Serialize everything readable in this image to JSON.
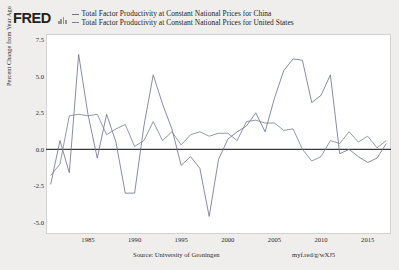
{
  "header": {
    "logo_text": "FRED",
    "logo_mark_name": "fred-bar-chart-mark"
  },
  "legend": {
    "items": [
      {
        "label": "Total Factor Productivity at Constant National Prices for China",
        "color": "#6a6f8e"
      },
      {
        "label": "Total Factor Productivity at Constant National Prices for United States",
        "color": "#7a7f96"
      }
    ]
  },
  "footer": {
    "source": "Source: University of Groningen",
    "url": "myf.red/g/wXJ5"
  },
  "chart_data": {
    "type": "line",
    "title": "",
    "xlabel": "",
    "ylabel": "Percent Change from Year Ago",
    "ylim": [
      -5.8,
      7.9
    ],
    "xlim": [
      1980.5,
      2017.5
    ],
    "yticks": [
      7.5,
      5.0,
      2.5,
      0.0,
      -2.5,
      -5.0
    ],
    "ytick_labels": [
      "7.5",
      "5.0",
      "2.5",
      "0.0",
      "-2.5",
      "-5.0"
    ],
    "xticks": [
      1985,
      1990,
      1995,
      2000,
      2005,
      2010,
      2015
    ],
    "xtick_labels": [
      "1985",
      "1990",
      "1995",
      "2000",
      "2005",
      "2010",
      "2015"
    ],
    "grid": false,
    "zero_line": true,
    "legend_position": "top",
    "x": [
      1981,
      1982,
      1983,
      1984,
      1985,
      1986,
      1987,
      1988,
      1989,
      1990,
      1991,
      1992,
      1993,
      1994,
      1995,
      1996,
      1997,
      1998,
      1999,
      2000,
      2001,
      2002,
      2003,
      2004,
      2005,
      2006,
      2007,
      2008,
      2009,
      2010,
      2011,
      2012,
      2013,
      2014,
      2015,
      2016,
      2017
    ],
    "series": [
      {
        "name": "Total Factor Productivity at Constant National Prices for China",
        "color": "#6a6f8e",
        "values": [
          -2.4,
          0.6,
          -1.6,
          6.5,
          2.4,
          -0.6,
          2.4,
          0.5,
          -3.0,
          -3.0,
          1.6,
          5.1,
          3.1,
          1.4,
          -1.1,
          -0.5,
          -1.3,
          -4.6,
          -0.7,
          0.7,
          1.2,
          1.6,
          2.5,
          1.2,
          3.5,
          5.4,
          6.2,
          6.1,
          3.2,
          3.7,
          5.1,
          -0.3,
          0.0,
          -0.5,
          -0.9,
          -0.6,
          0.4
        ]
      },
      {
        "name": "Total Factor Productivity at Constant National Prices for United States",
        "color": "#7a7f96",
        "values": [
          -1.8,
          -1.0,
          2.3,
          2.4,
          2.3,
          2.4,
          1.0,
          1.4,
          1.7,
          0.2,
          0.6,
          1.9,
          0.6,
          1.2,
          0.3,
          1.0,
          1.2,
          0.9,
          1.1,
          1.1,
          0.6,
          1.9,
          2.0,
          1.8,
          1.8,
          1.3,
          1.4,
          0.0,
          -0.8,
          -0.5,
          0.6,
          0.4,
          1.2,
          0.5,
          0.9,
          0.1,
          0.6
        ]
      }
    ]
  }
}
